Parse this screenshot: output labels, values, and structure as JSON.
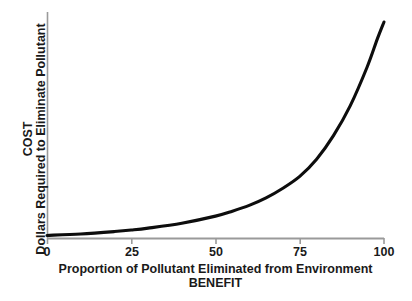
{
  "chart_data": {
    "type": "line",
    "title": "",
    "xlabel": "Proportion of Pollutant Eliminated from Environment",
    "xlabel_sub": "BENEFIT",
    "ylabel": "Dollars Required to Eliminate Pollutant",
    "ylabel_sub": "COST",
    "xlim": [
      0,
      100
    ],
    "ylim": [
      0,
      100
    ],
    "grid": false,
    "legend": "none",
    "xticks": [
      {
        "value": 0,
        "label": "0"
      },
      {
        "value": 25,
        "label": "25"
      },
      {
        "value": 50,
        "label": "50"
      },
      {
        "value": 75,
        "label": "75"
      },
      {
        "value": 100,
        "label": "100"
      }
    ],
    "yticks": [],
    "series": [
      {
        "name": "Cost of pollutant elimination",
        "color": "#000000",
        "x": [
          0,
          10,
          20,
          25,
          30,
          40,
          50,
          55,
          60,
          65,
          70,
          75,
          80,
          85,
          90,
          95,
          98,
          100
        ],
        "y": [
          0.5,
          1.2,
          2.3,
          3.0,
          3.9,
          6.2,
          9.5,
          11.8,
          14.5,
          18.0,
          22.5,
          28.0,
          36.0,
          47.0,
          61.0,
          79.0,
          92.0,
          100.0
        ]
      }
    ]
  },
  "axes": {
    "x_axis_color": "#9a9a9a",
    "y_axis_color": "#9a9a9a",
    "curve_color": "#0d0d0d",
    "background": "#ffffff"
  }
}
